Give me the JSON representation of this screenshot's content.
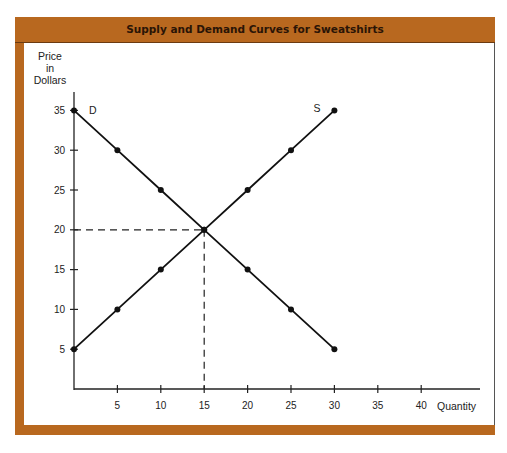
{
  "chart_data": {
    "type": "line",
    "title": "Supply and Demand Curves for Sweatshirts",
    "xlabel": "Quantity",
    "ylabel": "Price in Dollars",
    "ylabel_lines": [
      "Price",
      "in",
      "Dollars"
    ],
    "xlim": [
      0,
      42
    ],
    "ylim": [
      0,
      37
    ],
    "x_ticks": [
      5,
      10,
      15,
      20,
      25,
      30,
      35,
      40
    ],
    "y_ticks": [
      5,
      10,
      15,
      20,
      25,
      30,
      35
    ],
    "grid": false,
    "series": [
      {
        "name": "D",
        "label": "Demand",
        "x": [
          0,
          5,
          10,
          15,
          20,
          25,
          30
        ],
        "y": [
          35,
          30,
          25,
          20,
          15,
          10,
          5
        ]
      },
      {
        "name": "S",
        "label": "Supply",
        "x": [
          0,
          5,
          10,
          15,
          20,
          25,
          30
        ],
        "y": [
          5,
          10,
          15,
          20,
          25,
          30,
          35
        ]
      }
    ],
    "annotations": [
      {
        "type": "equilibrium",
        "x": 15,
        "y": 20,
        "style": "dashed guide lines to axes"
      }
    ]
  },
  "colors": {
    "frame": "#b8681f",
    "title_text": "#2a1406",
    "line": "#111111",
    "background": "#ffffff"
  }
}
